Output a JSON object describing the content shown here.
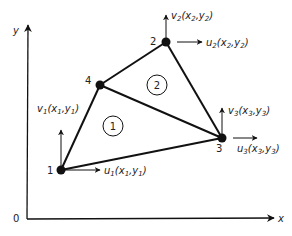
{
  "diagram": {
    "type": "finite-element-mesh",
    "axes": {
      "origin_label": "0",
      "x_label": "x",
      "y_label": "y"
    },
    "nodes": [
      {
        "id": "1",
        "label": "1",
        "u": "u",
        "u_sub": "1",
        "u_args": "(x",
        "u_a1": "1",
        "u_mid": ",y",
        "u_a2": "1",
        "v": "v",
        "v_sub": "1"
      },
      {
        "id": "2",
        "label": "2",
        "u": "u",
        "u_sub": "2",
        "v": "v",
        "v_sub": "2"
      },
      {
        "id": "3",
        "label": "3",
        "u": "u",
        "u_sub": "3",
        "v": "v",
        "v_sub": "3"
      },
      {
        "id": "4",
        "label": "4"
      }
    ],
    "elements": [
      {
        "id": "1",
        "label": "1",
        "nodes": [
          "1",
          "3",
          "4"
        ]
      },
      {
        "id": "2",
        "label": "2",
        "nodes": [
          "4",
          "3",
          "2"
        ]
      }
    ],
    "dof_labels": {
      "u1": "u1(x1,y1)",
      "v1": "v1(x1,y1)",
      "u2": "u2(x2,y2)",
      "v2": "v2(x2,y2)",
      "u3": "u3(x3,y3)",
      "v3": "v3(x3,y3)"
    },
    "colors": {
      "line": "#111111",
      "text": "#222222",
      "background": "#ffffff"
    }
  }
}
